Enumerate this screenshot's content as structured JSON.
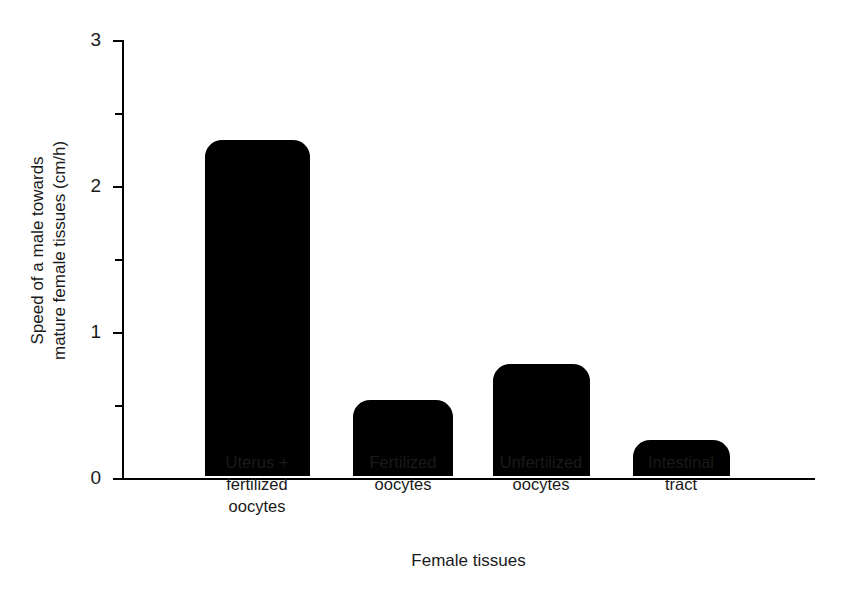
{
  "chart_data": {
    "type": "bar",
    "title": "",
    "categories": [
      "Uterus +\nfertilized\noocytes",
      "Fertilized\noocytes",
      "Unfertilized\noocytes",
      "Intestinal\ntract"
    ],
    "category_lines": [
      [
        "Uterus +",
        "fertilized",
        "oocytes"
      ],
      [
        "Fertilized",
        "oocytes"
      ],
      [
        "Unfertilized",
        "oocytes"
      ],
      [
        "Intestinal",
        "tract"
      ]
    ],
    "values": [
      2.3,
      0.52,
      0.77,
      0.25
    ],
    "xlabel": "Female tissues",
    "ylabel": "Speed of a male towards mature female tissues (cm/h)",
    "ylabel_lines": [
      "Speed of a male towards",
      "mature female tissues (cm/h)"
    ],
    "ylim": [
      0,
      3
    ],
    "y_major_ticks": [
      0,
      1,
      2,
      3
    ],
    "y_major_tick_labels": [
      "0",
      "1",
      "2",
      "3"
    ],
    "y_minor_ticks": [
      0.5,
      1.5,
      2.5
    ],
    "grid": false,
    "legend": false,
    "bar_color": "#000000",
    "axis_color": "#000000",
    "text_color": "#1a1a1a",
    "background": "#ffffff"
  }
}
